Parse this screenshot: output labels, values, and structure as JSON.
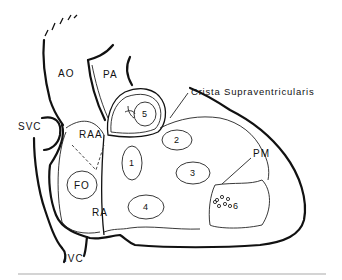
{
  "diagram": {
    "labels": {
      "ao": "AO",
      "pa": "PA",
      "svc": "SVC",
      "raa": "RAA",
      "fo": "FO",
      "ra": "RA",
      "ivc": "IVC",
      "crista": "Crista Supraventricularis",
      "pm": "PM"
    },
    "regions": [
      "1",
      "2",
      "3",
      "4",
      "5",
      "6"
    ]
  }
}
